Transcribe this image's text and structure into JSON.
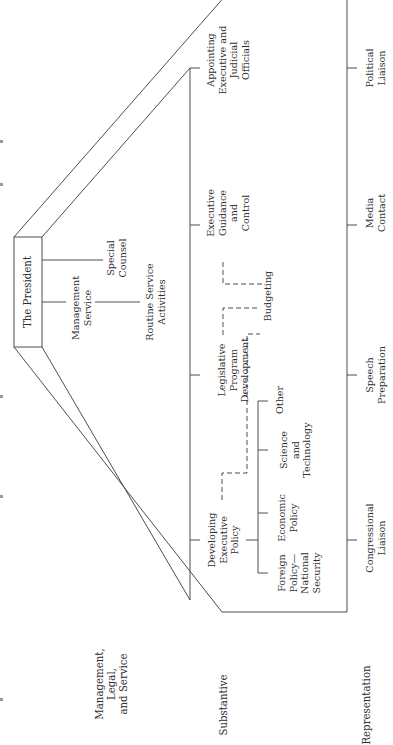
{
  "diagram": {
    "orientation": "rotated-90-ccw",
    "root": {
      "label": "The President"
    },
    "tiers": [
      {
        "name": "Management, Legal, and Service",
        "label": "Management,\nLegal,\nand Service",
        "items": [
          {
            "label": "Management\nService",
            "children": [
              {
                "label": "Routine Service\nActivities"
              }
            ]
          },
          {
            "label": "Special\nCounsel"
          }
        ]
      },
      {
        "name": "Substantive",
        "label": "Substantive",
        "items": [
          {
            "label": "Developing\nExecutive\nPolicy",
            "children": [
              {
                "label": "Foreign\nPolicy—\nNational\nSecurity"
              },
              {
                "label": "Economic\nPolicy"
              },
              {
                "label": "Science\nand\nTechnology"
              },
              {
                "label": "Other"
              }
            ]
          },
          {
            "label": "Legislative\nProgram\nDevelopment"
          },
          {
            "label": "Budgeting",
            "note": "linked by dashed lines"
          },
          {
            "label": "Executive\nGuidance\nand\nControl"
          },
          {
            "label": "Appointing\nExecutive and\nJudicial\nOfficials"
          }
        ]
      },
      {
        "name": "Representation",
        "label": "Representation",
        "items": [
          {
            "label": "Congressional\nLiaison"
          },
          {
            "label": "Speech\nPreparation"
          },
          {
            "label": "Media\nContact"
          },
          {
            "label": "Political\nLiaison"
          }
        ]
      }
    ]
  },
  "colors": {
    "line": "#3a3a3a",
    "text": "#2e2e2e",
    "background": "#ffffff"
  }
}
